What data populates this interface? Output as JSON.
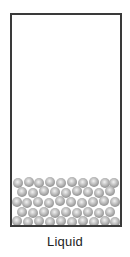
{
  "diagram": {
    "label": "Liquid",
    "container": {
      "border_color": "#3a3a3a",
      "fill_color": "#ffffff"
    },
    "particle": {
      "diameter": 10,
      "color": "#a0a0a0",
      "count": 47,
      "arrangement": "randomly packed, filling bottom of container"
    }
  }
}
